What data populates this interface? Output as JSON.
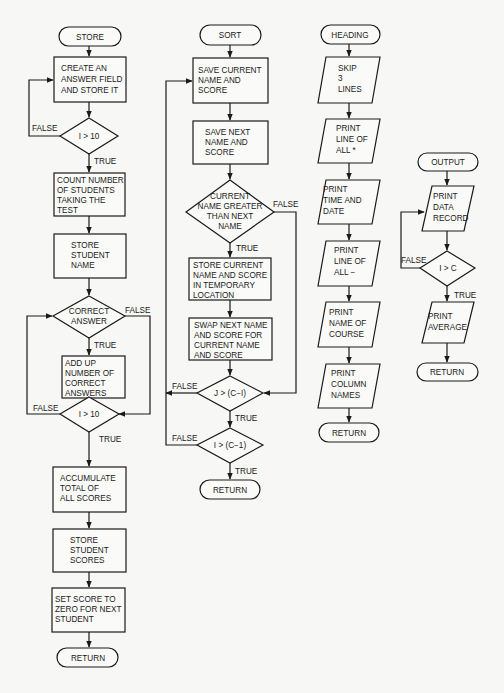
{
  "flowcharts": [
    {
      "name": "store",
      "start": "STORE",
      "nodes": [
        {
          "type": "process",
          "lines": [
            "CREATE AN",
            "ANSWER FIELD",
            "AND STORE IT"
          ]
        },
        {
          "type": "decision",
          "lines": [
            "I  >  10"
          ],
          "false_label": "FALSE",
          "true_label": "TRUE"
        },
        {
          "type": "process",
          "lines": [
            "COUNT NUMBER",
            "OF STUDENTS",
            "TAKING THE",
            "TEST"
          ]
        },
        {
          "type": "process",
          "lines": [
            "STORE",
            "STUDENT",
            "NAME"
          ]
        },
        {
          "type": "decision",
          "lines": [
            "CORRECT",
            "ANSWER"
          ],
          "false_label": "FALSE",
          "true_label": "TRUE"
        },
        {
          "type": "process",
          "lines": [
            "ADD UP",
            "NUMBER OF",
            "CORRECT",
            "ANSWERS"
          ]
        },
        {
          "type": "decision",
          "lines": [
            "I  >  10"
          ],
          "false_label": "FALSE",
          "true_label": "TRUE"
        },
        {
          "type": "process",
          "lines": [
            "ACCUMULATE",
            "TOTAL OF",
            "ALL SCORES"
          ]
        },
        {
          "type": "process",
          "lines": [
            "STORE",
            "STUDENT",
            "SCORES"
          ]
        },
        {
          "type": "process",
          "lines": [
            "SET SCORE TO",
            "ZERO FOR NEXT",
            "STUDENT"
          ]
        }
      ],
      "end": "RETURN"
    },
    {
      "name": "sort",
      "start": "SORT",
      "nodes": [
        {
          "type": "process",
          "lines": [
            "SAVE CURRENT",
            "NAME AND",
            "SCORE"
          ]
        },
        {
          "type": "process",
          "lines": [
            "SAVE NEXT",
            "NAME AND",
            "SCORE"
          ]
        },
        {
          "type": "decision",
          "lines": [
            "CURRENT",
            "NAME GREATER",
            "THAN NEXT",
            "NAME"
          ],
          "false_label": "FALSE",
          "true_label": "TRUE"
        },
        {
          "type": "process",
          "lines": [
            "STORE CURRENT",
            "NAME AND SCORE",
            "IN TEMPORARY",
            "LOCATION"
          ]
        },
        {
          "type": "process",
          "lines": [
            "SWAP NEXT NAME",
            "AND SCORE FOR",
            "CURRENT NAME",
            "AND SCORE"
          ]
        },
        {
          "type": "decision",
          "lines": [
            "J  >  (C−I)"
          ],
          "false_label": "FALSE",
          "true_label": "TRUE"
        },
        {
          "type": "decision",
          "lines": [
            "I  >  (C−1)"
          ],
          "false_label": "FALSE",
          "true_label": "TRUE"
        }
      ],
      "end": "RETURN"
    },
    {
      "name": "heading",
      "start": "HEADING",
      "nodes": [
        {
          "type": "io",
          "lines": [
            "SKIP",
            "3",
            "LINES"
          ]
        },
        {
          "type": "io",
          "lines": [
            "PRINT",
            "LINE OF",
            "ALL *"
          ]
        },
        {
          "type": "io",
          "lines": [
            "PRINT",
            "TIME AND",
            "DATE"
          ]
        },
        {
          "type": "io",
          "lines": [
            "PRINT",
            "LINE OF",
            "ALL  −"
          ]
        },
        {
          "type": "io",
          "lines": [
            "PRINT",
            "NAME OF",
            "COURSE"
          ]
        },
        {
          "type": "io",
          "lines": [
            "PRINT",
            "COLUMN",
            "NAMES"
          ]
        }
      ],
      "end": "RETURN"
    },
    {
      "name": "output",
      "start": "OUTPUT",
      "nodes": [
        {
          "type": "io",
          "lines": [
            "PRINT",
            "DATA",
            "RECORD"
          ]
        },
        {
          "type": "decision",
          "lines": [
            "I  >  C"
          ],
          "false_label": "FALSE",
          "true_label": "TRUE"
        },
        {
          "type": "io",
          "lines": [
            "PRINT",
            "AVERAGE"
          ]
        }
      ],
      "end": "RETURN"
    }
  ]
}
